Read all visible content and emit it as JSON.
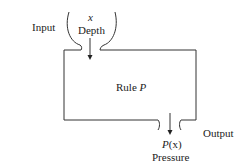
{
  "input": {
    "label": "Input",
    "variable": "x",
    "name": "Depth"
  },
  "rule": {
    "prefix": "Rule ",
    "name": "P"
  },
  "output": {
    "label": "Output",
    "function": "P",
    "arg": "(x)",
    "name": "Pressure"
  },
  "colors": {
    "stroke": "#333333"
  }
}
